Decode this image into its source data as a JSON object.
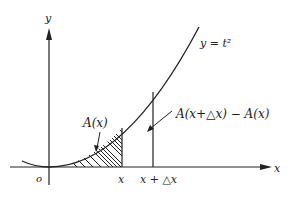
{
  "diagram": {
    "type": "area-under-curve",
    "curve_label": "y = t²",
    "labels": {
      "y_axis": "y",
      "x_axis": "x",
      "origin": "o",
      "x_mark": "x",
      "x_plus_dx_mark": "x + △x",
      "area": "A(x)",
      "area_increment": "A(x+△x) − A(x)",
      "curve": "y = t²"
    },
    "colors": {
      "ink": "#222222",
      "background": "#ffffff"
    }
  }
}
